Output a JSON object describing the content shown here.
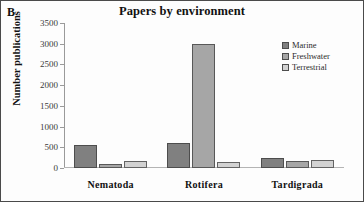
{
  "panel": {
    "letter": "B"
  },
  "chart_data": {
    "type": "bar",
    "title": "Papers by environment",
    "xlabel": "",
    "ylabel": "Number publications",
    "categories": [
      "Nematoda",
      "Rotifera",
      "Tardigrada"
    ],
    "series": [
      {
        "name": "Marine",
        "color": "#808080",
        "values": [
          550,
          600,
          250
        ]
      },
      {
        "name": "Freshwater",
        "color": "#a6a6a6",
        "values": [
          100,
          3000,
          160
        ]
      },
      {
        "name": "Terrestrial",
        "color": "#d2d2d2",
        "values": [
          180,
          150,
          200
        ]
      }
    ],
    "ylim": [
      0,
      3500
    ],
    "yticks": [
      0,
      500,
      1000,
      1500,
      2000,
      2500,
      3000,
      3500
    ],
    "ytick_labels": [
      "0",
      "500",
      "1000",
      "1500",
      "2000",
      "2500",
      "3000",
      "3500"
    ],
    "grid": false,
    "legend_position": "top-right"
  }
}
